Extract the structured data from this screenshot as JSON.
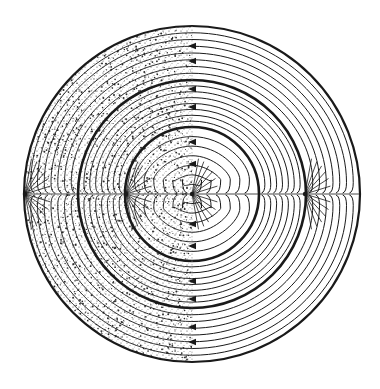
{
  "figure": {
    "colors": {
      "background": "#ffffff",
      "ink": "#1a1a1a",
      "stipple": "#2a2a2a"
    },
    "center": [
      192,
      194
    ],
    "circles": [
      {
        "name": "outer-circle",
        "r": 168,
        "stroke_width": 2.2
      },
      {
        "name": "middle-circle",
        "r": 114,
        "stroke_width": 2.6
      },
      {
        "name": "inner-circle",
        "r": 67,
        "stroke_width": 2.6
      }
    ],
    "sources": [
      {
        "name": "left-outer-source",
        "x": 25,
        "y": 194
      },
      {
        "name": "left-inner-source",
        "x": 126,
        "y": 194
      },
      {
        "name": "center-source",
        "x": 192,
        "y": 194
      },
      {
        "name": "right-source",
        "x": 305,
        "y": 194
      }
    ],
    "midline_arrows_y": [
      46,
      61,
      89,
      107,
      142,
      164,
      224,
      246,
      281,
      299,
      327,
      342
    ],
    "arrow_direction": "left"
  }
}
